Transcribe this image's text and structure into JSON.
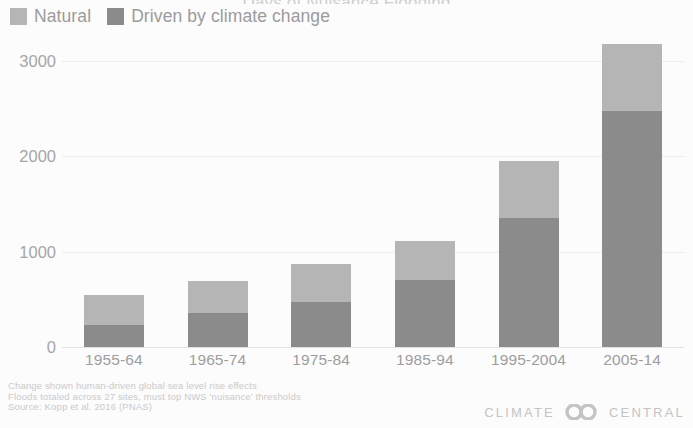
{
  "chart_data": {
    "type": "bar",
    "subtype": "stacked-bar",
    "title": "Days of Nuisance Flooding",
    "xlabel": "",
    "ylabel": "",
    "categories": [
      "1955-64",
      "1965-74",
      "1975-84",
      "1985-94",
      "1995-2004",
      "2005-14"
    ],
    "series": [
      {
        "name": "Driven by climate change",
        "color": "#8b8b8b",
        "values": [
          230,
          355,
          470,
          700,
          1350,
          2480
        ]
      },
      {
        "name": "Natural",
        "color": "#b5b5b5",
        "values": [
          315,
          335,
          400,
          410,
          600,
          700
        ]
      }
    ],
    "totals": [
      545,
      690,
      870,
      1110,
      1950,
      3180
    ],
    "ylim": [
      0,
      3300
    ],
    "yticks": [
      0,
      1000,
      2000,
      3000
    ],
    "ytick_labels": [
      "0",
      "1000",
      "2000",
      "3000"
    ],
    "grid": true,
    "grid_axis": "y",
    "legend_position": "top-left",
    "stack_order": [
      "Driven by climate change",
      "Natural"
    ]
  },
  "legend": {
    "items": [
      {
        "label": "Natural",
        "color": "#b5b5b5"
      },
      {
        "label": "Driven by climate change",
        "color": "#8b8b8b"
      }
    ]
  },
  "footnotes": {
    "lines": [
      "Change shown human-driven global sea level rise effects",
      "Floods totaled across 27 sites, must top NWS 'nuisance' thresholds",
      "Source: Kopp et al. 2016 (PNAS)"
    ]
  },
  "logo": {
    "left_word": "CLIMATE",
    "right_word": "CENTRAL",
    "mark_name": "two-overlapping-circles"
  },
  "colors": {
    "natural": "#b5b5b5",
    "driven": "#8b8b8b",
    "axis_text": "#a6a6a6",
    "grid": "#ededed",
    "footnote_text": "#cacaca"
  }
}
